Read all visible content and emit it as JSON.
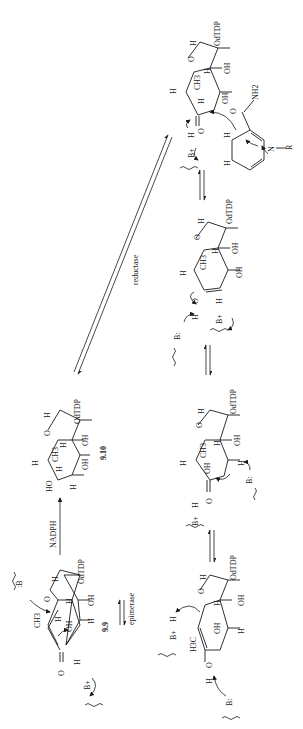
{
  "scheme": {
    "orientation": "rotated 90° counter-clockwise",
    "compounds": {
      "c99": {
        "label": "9.9",
        "substituents": [
          "CH3",
          "H",
          "OH",
          "H",
          "OH",
          "H",
          "OdTDP",
          "O",
          "H"
        ]
      },
      "c910": {
        "label": "9.10",
        "substituents": [
          "HO",
          "H",
          "H",
          "CH3",
          "H",
          "OH",
          "H",
          "OH",
          "H",
          "OdTDP",
          "O"
        ]
      }
    },
    "labels": {
      "otdp": "OdTDP",
      "oh": "OH",
      "ho": "HO",
      "h": "H",
      "o": "O",
      "ch3": "CH3",
      "ch3_sub": "3",
      "h3c": "H3C",
      "nh2": "NH2",
      "n": "N",
      "r": "R",
      "b_plus": "B+",
      "b_colon": "B:",
      "colon_b": ":B",
      "label_99": "9.9",
      "label_910": "9.10"
    },
    "reagents": {
      "nadph": "NADPH",
      "epimerase": "epimerase",
      "reductase": "reductase"
    },
    "colors": {
      "ink": "#1a1a1a",
      "background": "#ffffff"
    }
  }
}
